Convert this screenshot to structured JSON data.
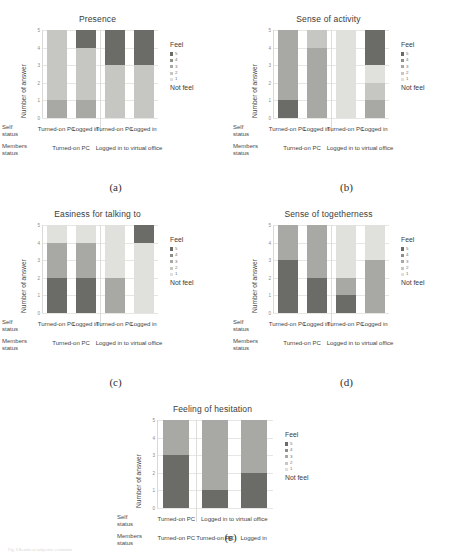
{
  "figure": {
    "bottom_caption": "Fig. 8  Results of subjective evaluation"
  },
  "axis": {
    "ylabel": "Number of answer",
    "yticks": [
      "5",
      "4",
      "3",
      "2",
      "1",
      "0"
    ],
    "ylim": [
      0,
      5
    ]
  },
  "legend": {
    "head": "Feel",
    "foot": "Not\nfeel",
    "items": [
      {
        "label": "5",
        "color": "#6b6b68"
      },
      {
        "label": "4",
        "color": "#8e8e8b"
      },
      {
        "label": "3",
        "color": "#a8a8a4"
      },
      {
        "label": "2",
        "color": "#c6c6c2"
      },
      {
        "label": "1",
        "color": "#e0e0dc"
      }
    ]
  },
  "rowlabels": {
    "self": "Self\nstatus",
    "members": "Members\nstatus"
  },
  "labels": {
    "turned_on_pc": "Turned-on PC",
    "logged_in": "Logged in",
    "logged_in_office": "Logged in to virtual office"
  },
  "colors": {
    "c5": "#6b6b68",
    "c4": "#8e8e8b",
    "c3": "#a8a8a4",
    "c2": "#c6c6c2",
    "c1": "#e0e0dc"
  },
  "chart_data": [
    {
      "id": "a",
      "type": "bar",
      "title": "Presence",
      "caption": "(a)",
      "xlabel": "",
      "ylabel": "Number of answer",
      "ylim": [
        0,
        5
      ],
      "grid": true,
      "legend_position": "right",
      "self_status": [
        "Turned-on PC",
        "Logged in",
        "Turned-on PC",
        "Logged in"
      ],
      "members_status": [
        {
          "label": "Turned-on PC",
          "span": 2
        },
        {
          "label": "Logged in to virtual office",
          "span": 2
        }
      ],
      "series": [
        {
          "name": "1",
          "color": "#e0e0dc",
          "values": [
            0,
            0,
            0,
            0
          ]
        },
        {
          "name": "2",
          "color": "#c6c6c2",
          "values": [
            4,
            3,
            3,
            3
          ]
        },
        {
          "name": "3",
          "color": "#a8a8a4",
          "values": [
            1,
            1,
            0,
            0
          ]
        },
        {
          "name": "4",
          "color": "#8e8e8b",
          "values": [
            0,
            0,
            0,
            0
          ]
        },
        {
          "name": "5",
          "color": "#6b6b68",
          "values": [
            0,
            1,
            2,
            2
          ]
        }
      ],
      "bars": [
        {
          "self": "Turned-on PC",
          "segments": [
            {
              "level": "3",
              "value": 1
            },
            {
              "level": "2",
              "value": 4
            }
          ]
        },
        {
          "self": "Logged in",
          "segments": [
            {
              "level": "3",
              "value": 1
            },
            {
              "level": "2",
              "value": 3
            },
            {
              "level": "5",
              "value": 1
            }
          ]
        },
        {
          "self": "Turned-on PC",
          "segments": [
            {
              "level": "2",
              "value": 3
            },
            {
              "level": "5",
              "value": 2
            }
          ]
        },
        {
          "self": "Logged in",
          "segments": [
            {
              "level": "2",
              "value": 3
            },
            {
              "level": "5",
              "value": 2
            }
          ]
        }
      ]
    },
    {
      "id": "b",
      "type": "bar",
      "title": "Sense of activity",
      "caption": "(b)",
      "xlabel": "",
      "ylabel": "Number of answer",
      "ylim": [
        0,
        5
      ],
      "grid": true,
      "legend_position": "right",
      "self_status": [
        "Turned-on PC",
        "Logged in",
        "Turned-on PC",
        "Logged in"
      ],
      "members_status": [
        {
          "label": "Turned-on PC",
          "span": 2
        },
        {
          "label": "Logged in to virtual office",
          "span": 2
        }
      ],
      "bars": [
        {
          "self": "Turned-on PC",
          "segments": [
            {
              "level": "5",
              "value": 1
            },
            {
              "level": "3",
              "value": 4
            }
          ]
        },
        {
          "self": "Logged in",
          "segments": [
            {
              "level": "3",
              "value": 4
            },
            {
              "level": "2",
              "value": 1
            }
          ]
        },
        {
          "self": "Turned-on PC",
          "segments": [
            {
              "level": "1",
              "value": 5
            }
          ]
        },
        {
          "self": "Logged in",
          "segments": [
            {
              "level": "3",
              "value": 1
            },
            {
              "level": "2",
              "value": 1
            },
            {
              "level": "1",
              "value": 1
            },
            {
              "level": "5",
              "value": 2
            }
          ]
        }
      ]
    },
    {
      "id": "c",
      "type": "bar",
      "title": "Easiness for talking to",
      "caption": "(c)",
      "xlabel": "",
      "ylabel": "Number of answer",
      "ylim": [
        0,
        5
      ],
      "grid": true,
      "legend_position": "right",
      "self_status": [
        "Turned-on PC",
        "Logged in",
        "Turned-on PC",
        "Logged in"
      ],
      "members_status": [
        {
          "label": "Turned-on PC",
          "span": 2
        },
        {
          "label": "Logged in to virtual office",
          "span": 2
        }
      ],
      "bars": [
        {
          "self": "Turned-on PC",
          "segments": [
            {
              "level": "5",
              "value": 2
            },
            {
              "level": "3",
              "value": 2
            },
            {
              "level": "1",
              "value": 1
            }
          ]
        },
        {
          "self": "Logged in",
          "segments": [
            {
              "level": "5",
              "value": 2
            },
            {
              "level": "3",
              "value": 2
            },
            {
              "level": "1",
              "value": 1
            }
          ]
        },
        {
          "self": "Turned-on PC",
          "segments": [
            {
              "level": "3",
              "value": 2
            },
            {
              "level": "1",
              "value": 3
            }
          ]
        },
        {
          "self": "Logged in",
          "segments": [
            {
              "level": "1",
              "value": 4
            },
            {
              "level": "5",
              "value": 1
            }
          ]
        }
      ]
    },
    {
      "id": "d",
      "type": "bar",
      "title": "Sense of togetherness",
      "caption": "(d)",
      "xlabel": "",
      "ylabel": "Number of answer",
      "ylim": [
        0,
        5
      ],
      "grid": true,
      "legend_position": "right",
      "self_status": [
        "Turned-on PC",
        "Logged in",
        "Turned-on PC",
        "Logged in"
      ],
      "members_status": [
        {
          "label": "Turned-on PC",
          "span": 2
        },
        {
          "label": "Logged in to virtual office",
          "span": 2
        }
      ],
      "bars": [
        {
          "self": "Turned-on PC",
          "segments": [
            {
              "level": "5",
              "value": 3
            },
            {
              "level": "3",
              "value": 2
            }
          ]
        },
        {
          "self": "Logged in",
          "segments": [
            {
              "level": "5",
              "value": 2
            },
            {
              "level": "3",
              "value": 3
            }
          ]
        },
        {
          "self": "Turned-on PC",
          "segments": [
            {
              "level": "5",
              "value": 1
            },
            {
              "level": "3",
              "value": 1
            },
            {
              "level": "1",
              "value": 3
            }
          ]
        },
        {
          "self": "Logged in",
          "segments": [
            {
              "level": "3",
              "value": 3
            },
            {
              "level": "1",
              "value": 2
            }
          ]
        }
      ]
    },
    {
      "id": "e",
      "type": "bar",
      "title": "Feeling of hesitation",
      "caption": "(e)",
      "xlabel": "",
      "ylabel": "Number of answer",
      "ylim": [
        0,
        5
      ],
      "grid": true,
      "legend_position": "right",
      "self_status": [
        "Turned-on PC",
        "Logged in to virtual office"
      ],
      "self_spans": [
        1,
        2
      ],
      "members_status": [
        "Turned-on PC",
        "Turned-on PC",
        "Logged in"
      ],
      "bars": [
        {
          "self": "Turned-on PC",
          "segments": [
            {
              "level": "5",
              "value": 3
            },
            {
              "level": "3",
              "value": 2
            }
          ]
        },
        {
          "self": "Turned-on PC",
          "segments": [
            {
              "level": "5",
              "value": 1
            },
            {
              "level": "3",
              "value": 4
            }
          ]
        },
        {
          "self": "Logged in",
          "segments": [
            {
              "level": "5",
              "value": 2
            },
            {
              "level": "3",
              "value": 3
            }
          ]
        }
      ]
    }
  ]
}
